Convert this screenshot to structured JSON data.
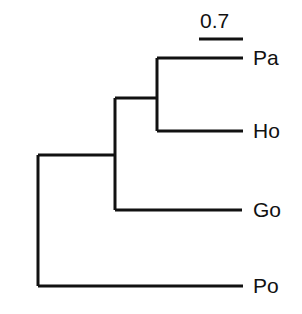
{
  "figure": {
    "type": "phylogenetic-tree",
    "orientation": "rectangular-cladogram-left-to-right",
    "background_color": "#ffffff",
    "line_color": "#111111",
    "line_width_px": 3
  },
  "scale_bar": {
    "label": "0.7",
    "units": "substitutions per site",
    "label_x": 200,
    "label_y": 10,
    "bar_x_start": 199,
    "bar_x_end": 243,
    "bar_y": 39,
    "bar_length_px": 44
  },
  "taxa": [
    {
      "id": "pa",
      "label": "Pa",
      "tip_y": 58,
      "tip_x_end": 243,
      "label_x": 253,
      "label_y": 47
    },
    {
      "id": "ho",
      "label": "Ho",
      "tip_y": 131,
      "tip_x_end": 243,
      "label_x": 253,
      "label_y": 120
    },
    {
      "id": "go",
      "label": "Go",
      "tip_y": 210,
      "tip_x_end": 242,
      "label_x": 253,
      "label_y": 199
    },
    {
      "id": "po",
      "label": "Po",
      "tip_y": 286,
      "tip_x_end": 243,
      "label_x": 253,
      "label_y": 275
    }
  ],
  "nodes": [
    {
      "id": "node-pa-ho",
      "name": "clade-pa-ho",
      "x": 157,
      "y_top": 58,
      "y_bottom": 131,
      "y_center": 98,
      "children": [
        "pa",
        "ho"
      ]
    },
    {
      "id": "node-pa-ho-go",
      "name": "clade-pa-ho-go",
      "x": 115,
      "y_top": 98,
      "y_bottom": 210,
      "y_center": 155,
      "children": [
        "node-pa-ho",
        "go"
      ]
    },
    {
      "id": "node-root",
      "name": "root",
      "x": 38,
      "y_top": 155,
      "y_bottom": 286,
      "y_center": 155,
      "children": [
        "node-pa-ho-go",
        "po"
      ]
    }
  ],
  "branches": [
    {
      "id": "branch-pa",
      "name": "branch-to-pa",
      "x1": 157,
      "y1": 58,
      "x2": 243,
      "y2": 58
    },
    {
      "id": "branch-ho",
      "name": "branch-to-ho",
      "x1": 157,
      "y1": 131,
      "x2": 243,
      "y2": 131
    },
    {
      "id": "branch-go",
      "name": "branch-to-go",
      "x1": 115,
      "y1": 210,
      "x2": 242,
      "y2": 210
    },
    {
      "id": "branch-po",
      "name": "branch-to-po",
      "x1": 38,
      "y1": 286,
      "x2": 243,
      "y2": 286
    },
    {
      "id": "branch-node-paho",
      "name": "branch-to-clade-pa-ho",
      "x1": 115,
      "y1": 98,
      "x2": 157,
      "y2": 98
    },
    {
      "id": "branch-node-root",
      "name": "branch-root-stem",
      "x1": 38,
      "y1": 155,
      "x2": 115,
      "y2": 155
    }
  ],
  "connectors": [
    {
      "id": "conn-pa-ho",
      "name": "vertical-connector-pa-ho",
      "x": 157,
      "y1": 58,
      "y2": 131
    },
    {
      "id": "conn-pa-ho-go",
      "name": "vertical-connector-pa-ho-go",
      "x": 115,
      "y1": 98,
      "y2": 210
    },
    {
      "id": "conn-root",
      "name": "vertical-connector-root",
      "x": 38,
      "y1": 155,
      "y2": 286
    }
  ]
}
